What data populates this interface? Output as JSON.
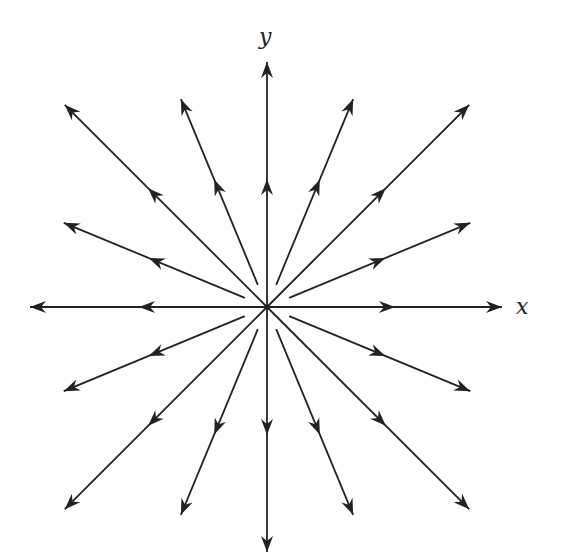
{
  "figure": {
    "type": "radial-vector-field",
    "origin": {
      "x": 267,
      "y": 307
    },
    "stroke_color": "#222222",
    "background": "#ffffff",
    "labels": {
      "x_axis": "x",
      "y_axis": "y"
    },
    "axes": {
      "x": {
        "from": [
          30,
          307
        ],
        "to": [
          502,
          307
        ]
      },
      "y": {
        "from": [
          267,
          552
        ],
        "to": [
          267,
          62
        ]
      }
    },
    "rays": [
      {
        "angle_deg": 0,
        "inner_r": 0,
        "outer_r": 235,
        "mid_arrow_r": 120
      },
      {
        "angle_deg": 22.5,
        "inner_r": 24,
        "outer_r": 220,
        "mid_arrow_r": 120
      },
      {
        "angle_deg": 45,
        "inner_r": 0,
        "outer_r": 286,
        "mid_arrow_r": 160
      },
      {
        "angle_deg": 67.5,
        "inner_r": 24,
        "outer_r": 225,
        "mid_arrow_r": 130
      },
      {
        "angle_deg": 90,
        "inner_r": 0,
        "outer_r": 245,
        "mid_arrow_r": 120
      },
      {
        "angle_deg": 112.5,
        "inner_r": 24,
        "outer_r": 225,
        "mid_arrow_r": 130
      },
      {
        "angle_deg": 135,
        "inner_r": 0,
        "outer_r": 286,
        "mid_arrow_r": 160
      },
      {
        "angle_deg": 157.5,
        "inner_r": 24,
        "outer_r": 220,
        "mid_arrow_r": 120
      },
      {
        "angle_deg": 180,
        "inner_r": 0,
        "outer_r": 237,
        "mid_arrow_r": 120
      },
      {
        "angle_deg": 202.5,
        "inner_r": 24,
        "outer_r": 220,
        "mid_arrow_r": 120
      },
      {
        "angle_deg": 225,
        "inner_r": 0,
        "outer_r": 286,
        "mid_arrow_r": 160
      },
      {
        "angle_deg": 247.5,
        "inner_r": 24,
        "outer_r": 225,
        "mid_arrow_r": 130
      },
      {
        "angle_deg": 270,
        "inner_r": 0,
        "outer_r": 245,
        "mid_arrow_r": 120
      },
      {
        "angle_deg": 292.5,
        "inner_r": 24,
        "outer_r": 225,
        "mid_arrow_r": 130
      },
      {
        "angle_deg": 315,
        "inner_r": 0,
        "outer_r": 286,
        "mid_arrow_r": 160
      },
      {
        "angle_deg": 337.5,
        "inner_r": 24,
        "outer_r": 220,
        "mid_arrow_r": 120
      }
    ]
  }
}
